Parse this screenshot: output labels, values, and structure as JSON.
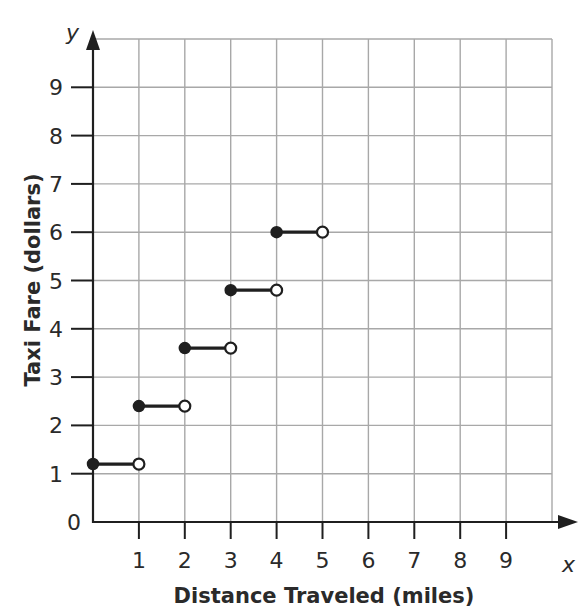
{
  "chart_data": {
    "type": "line",
    "subtype": "step-function",
    "title": "",
    "xlabel": "Distance Traveled (miles)",
    "ylabel": "Taxi Fare (dollars)",
    "x_var": "x",
    "y_var": "y",
    "xlim": [
      0,
      10
    ],
    "ylim": [
      0,
      10
    ],
    "x_ticks": [
      1,
      2,
      3,
      4,
      5,
      6,
      7,
      8,
      9
    ],
    "y_ticks": [
      1,
      2,
      3,
      4,
      5,
      6,
      7,
      8,
      9
    ],
    "origin_label": "0",
    "grid": true,
    "legend": null,
    "series": [
      {
        "name": "Taxi Fare",
        "segments": [
          {
            "x_start": 0,
            "x_end": 1,
            "y": 1.2,
            "start_closed": true,
            "end_closed": false
          },
          {
            "x_start": 1,
            "x_end": 2,
            "y": 2.4,
            "start_closed": true,
            "end_closed": false
          },
          {
            "x_start": 2,
            "x_end": 3,
            "y": 3.6,
            "start_closed": true,
            "end_closed": false
          },
          {
            "x_start": 3,
            "x_end": 4,
            "y": 4.8,
            "start_closed": true,
            "end_closed": false
          },
          {
            "x_start": 4,
            "x_end": 5,
            "y": 6.0,
            "start_closed": true,
            "end_closed": false
          }
        ]
      }
    ]
  },
  "colors": {
    "grid": "#a8a8a8",
    "axis": "#1f1f1f",
    "text": "#2a2a2a",
    "background": "#ffffff"
  }
}
